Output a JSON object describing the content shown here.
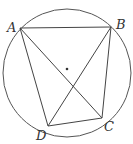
{
  "diagram": {
    "type": "geometry",
    "circle": {
      "cx": 67,
      "cy": 73,
      "r": 64,
      "center_marked": true
    },
    "points": {
      "A": {
        "label": "A",
        "x": 20,
        "y": 28
      },
      "B": {
        "label": "B",
        "x": 111,
        "y": 27
      },
      "C": {
        "label": "C",
        "x": 102,
        "y": 118
      },
      "D": {
        "label": "D",
        "x": 48,
        "y": 126
      }
    },
    "segments": [
      "AB",
      "BC",
      "CD",
      "DA",
      "AC",
      "BD"
    ],
    "stroke_color": "#444444"
  }
}
